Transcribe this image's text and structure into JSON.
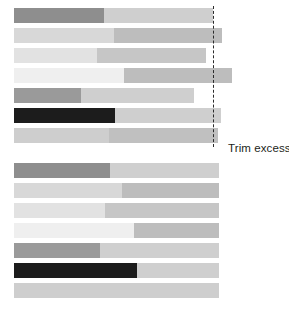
{
  "figure": {
    "width": 289,
    "height": 314,
    "background": "#ffffff",
    "annotation_label": "Trim excess"
  },
  "palette": {
    "dark_gray": "#8e8e8e",
    "mid_gray": "#9a9a9a",
    "light_gray": "#d8d8d8",
    "pale_gray": "#e2e2e2",
    "very_pale_gray": "#efefef",
    "soft_gray": "#cecece",
    "black": "#1c1c1c",
    "fill_light": "#cfcfcf",
    "fill_mid": "#bdbdbd",
    "fill_soft": "#c6c6c6",
    "dash_color": "#2b2b2b",
    "text_color": "#231f20"
  },
  "chart_data": {
    "type": "bar",
    "orientation": "horizontal",
    "title": "",
    "xlabel": "",
    "ylabel": "",
    "grid": false,
    "legend": false,
    "annotations": [
      {
        "text": "Trim excess",
        "x": 228,
        "y": 148
      }
    ],
    "trim_line_x": 213,
    "groups": [
      {
        "name": "untrimmed",
        "top": 8,
        "row_pitch": 20,
        "bar_height": 15,
        "bar_left": 14,
        "rows": [
          {
            "index": 1,
            "start": 14,
            "split": 104,
            "end": 213,
            "left_color": "#8e8e8e",
            "right_color": "#cfcfcf"
          },
          {
            "index": 2,
            "start": 14,
            "split": 114,
            "end": 222,
            "left_color": "#d8d8d8",
            "right_color": "#bdbdbd"
          },
          {
            "index": 3,
            "start": 14,
            "split": 97,
            "end": 206,
            "left_color": "#e2e2e2",
            "right_color": "#c6c6c6"
          },
          {
            "index": 4,
            "start": 14,
            "split": 124,
            "end": 232,
            "left_color": "#efefef",
            "right_color": "#bdbdbd"
          },
          {
            "index": 5,
            "start": 14,
            "split": 81,
            "end": 194,
            "left_color": "#9a9a9a",
            "right_color": "#cfcfcf"
          },
          {
            "index": 6,
            "start": 14,
            "split": 115,
            "end": 221,
            "left_color": "#1c1c1c",
            "right_color": "#cfcfcf"
          },
          {
            "index": 7,
            "start": 14,
            "split": 109,
            "end": 218,
            "left_color": "#cecece",
            "right_color": "#c0c0c0"
          }
        ]
      },
      {
        "name": "trimmed",
        "top": 163,
        "row_pitch": 20,
        "bar_height": 15,
        "bar_left": 14,
        "rows": [
          {
            "index": 1,
            "start": 14,
            "split": 110,
            "end": 219,
            "left_color": "#8e8e8e",
            "right_color": "#cfcfcf"
          },
          {
            "index": 2,
            "start": 14,
            "split": 122,
            "end": 219,
            "left_color": "#d8d8d8",
            "right_color": "#bdbdbd"
          },
          {
            "index": 3,
            "start": 14,
            "split": 105,
            "end": 219,
            "left_color": "#e2e2e2",
            "right_color": "#c6c6c6"
          },
          {
            "index": 4,
            "start": 14,
            "split": 134,
            "end": 219,
            "left_color": "#efefef",
            "right_color": "#bdbdbd"
          },
          {
            "index": 5,
            "start": 14,
            "split": 100,
            "end": 219,
            "left_color": "#9a9a9a",
            "right_color": "#cfcfcf"
          },
          {
            "index": 6,
            "start": 14,
            "split": 137,
            "end": 219,
            "left_color": "#1c1c1c",
            "right_color": "#cfcfcf"
          },
          {
            "index": 7,
            "start": 14,
            "split": 110,
            "end": 219,
            "left_color": "#cecece",
            "right_color": "#cecece"
          }
        ]
      }
    ]
  }
}
